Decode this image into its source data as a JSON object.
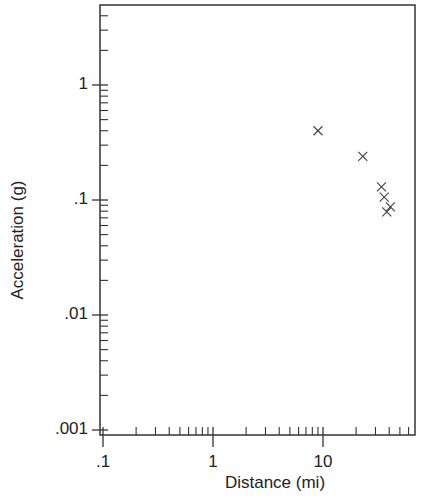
{
  "chart_data": {
    "type": "scatter",
    "title": "",
    "xlabel": "Distance (mi)",
    "ylabel": "Acceleration (g)",
    "xscale": "log",
    "yscale": "log",
    "xlim": [
      0.1,
      68
    ],
    "ylim": [
      0.00093,
      5
    ],
    "x_ticks": [
      {
        "value": 0.1,
        "label": ".1"
      },
      {
        "value": 1,
        "label": "1"
      },
      {
        "value": 10,
        "label": "10"
      }
    ],
    "y_ticks": [
      {
        "value": 0.001,
        "label": ".001"
      },
      {
        "value": 0.01,
        "label": ".01"
      },
      {
        "value": 0.1,
        "label": ".1"
      },
      {
        "value": 1,
        "label": "1"
      }
    ],
    "grid": false,
    "legend": null,
    "marker": "x",
    "series": [
      {
        "name": "observations",
        "points": [
          {
            "x": 9.0,
            "y": 0.4
          },
          {
            "x": 23,
            "y": 0.24
          },
          {
            "x": 34,
            "y": 0.13
          },
          {
            "x": 36,
            "y": 0.106
          },
          {
            "x": 41,
            "y": 0.087
          },
          {
            "x": 38,
            "y": 0.079
          }
        ]
      }
    ]
  },
  "layout": {
    "plot_left": 100,
    "plot_top": 5,
    "plot_right": 415,
    "plot_bottom": 435,
    "x_decade_px": 110,
    "x_one_px": 213,
    "y_decade_px": 115,
    "y_one_px": 85,
    "ink": "#333333"
  }
}
